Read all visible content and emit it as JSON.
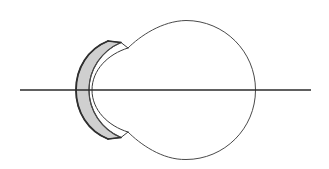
{
  "figure": {
    "title": "Schematic horizontal cross-section of the human eye",
    "caption": "",
    "width": 329,
    "height": 169,
    "background_color": "#ffffff"
  },
  "colors": {
    "outline_stroke": "#3a3a3a",
    "globe_stroke": "#4a4a4a",
    "axis_stroke": "#2b2b2b",
    "cornea_fill": "#cfcfcf",
    "cornea_stroke": "#3a3a3a",
    "anterior_chamber_fill": "#ffffff",
    "page_background": "#ffffff"
  },
  "optical_axis": {
    "label": "optical axis",
    "x_start": 20,
    "x_end": 311,
    "y": 90,
    "stroke_width": 1.6
  },
  "globe": {
    "label": "sclera / eyeball globe",
    "center_x": 186,
    "center_y": 90,
    "radius": 69.5,
    "stroke_width": 1.0,
    "fill": "none",
    "top_y": 21,
    "bottom_y": 160,
    "right_x": 255
  },
  "limbus": {
    "label": "limbus junction notches",
    "upper_point_x": 128,
    "upper_point_y": 48,
    "lower_point_x": 128,
    "lower_point_y": 132
  },
  "cornea": {
    "label": "cornea",
    "fill": "#cfcfcf",
    "stroke_width": 1.2,
    "apex_x": 76,
    "apex_y": 90,
    "top_tip_x": 108,
    "top_tip_y": 41,
    "bottom_tip_x": 108,
    "bottom_tip_y": 139,
    "thickness": 11
  },
  "anterior_chamber": {
    "label": "anterior chamber",
    "apex_x": 92,
    "apex_y": 90
  },
  "annotations": [],
  "chart_data": {
    "type": "table",
    "columns": [
      "element",
      "kind",
      "key dimensions"
    ],
    "rows": [
      [
        "optical axis",
        "horizontal line",
        "x 20 to 311 at y 90"
      ],
      [
        "globe (sclera)",
        "circle outline",
        "center (186, 90), r 69.5"
      ],
      [
        "cornea",
        "grey filled crescent",
        "apex x 76, tips y 41 and y 139"
      ],
      [
        "anterior chamber",
        "white crescent gap",
        "apex x 92"
      ],
      [
        "limbus notches",
        "kinks in outline",
        "(128, 48) and (128, 132)"
      ]
    ]
  }
}
